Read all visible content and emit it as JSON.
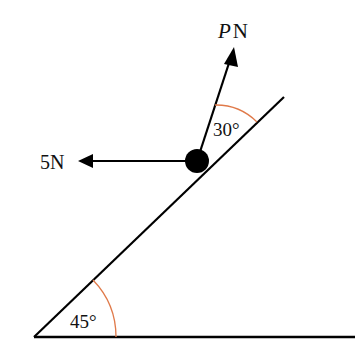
{
  "diagram": {
    "type": "inclined-plane-force-diagram",
    "forces": {
      "p_label_var": "P",
      "p_label_unit": "N",
      "horizontal_label": "5N"
    },
    "angles": {
      "incline": "45°",
      "p_to_incline": "30°"
    },
    "colors": {
      "lines": "#000000",
      "angle_arcs": "#e07a4a"
    }
  }
}
